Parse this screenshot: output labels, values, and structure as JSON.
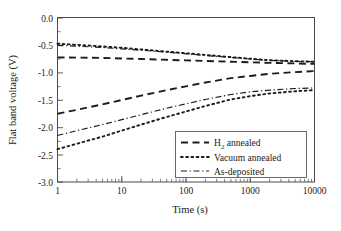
{
  "chart_data": {
    "type": "line",
    "title": "",
    "xlabel": "Time (s)",
    "ylabel": "Flat band voltage (V)",
    "xscale": "log",
    "yscale": "linear",
    "xlim": [
      1,
      10000
    ],
    "ylim": [
      -3.0,
      0.0
    ],
    "grid": false,
    "legend_position": "lower right",
    "xticks": [
      1,
      10,
      100,
      1000,
      10000
    ],
    "xticklabels": [
      "1",
      "10",
      "100",
      "1000",
      "10000"
    ],
    "yticks": [
      0.0,
      -0.5,
      -1.0,
      -1.5,
      -2.0,
      -2.5,
      -3.0
    ],
    "yticklabels": [
      "0.0",
      "-0.5",
      "-1.0",
      "-1.5",
      "-2.0",
      "-2.5",
      "-3.0"
    ],
    "series": [
      {
        "name": "H2 annealed (upper)",
        "legend": "H₂ annealed",
        "style": "dashed",
        "x": [
          1,
          2,
          5,
          10,
          20,
          50,
          100,
          200,
          500,
          1000,
          2000,
          5000,
          10000
        ],
        "y": [
          -0.72,
          -0.725,
          -0.73,
          -0.74,
          -0.75,
          -0.765,
          -0.775,
          -0.785,
          -0.8,
          -0.81,
          -0.82,
          -0.83,
          -0.84
        ]
      },
      {
        "name": "Vacuum annealed (upper)",
        "legend": "Vacuum annealed",
        "style": "dotted",
        "x": [
          1,
          2,
          5,
          10,
          20,
          50,
          100,
          200,
          500,
          1000,
          2000,
          5000,
          10000
        ],
        "y": [
          -0.47,
          -0.49,
          -0.52,
          -0.545,
          -0.575,
          -0.615,
          -0.645,
          -0.675,
          -0.715,
          -0.745,
          -0.772,
          -0.79,
          -0.8
        ]
      },
      {
        "name": "As-deposited (upper)",
        "legend": "As-deposited",
        "style": "dashdot",
        "x": [
          1,
          2,
          5,
          10,
          20,
          50,
          100,
          200,
          500,
          1000,
          2000,
          5000,
          10000
        ],
        "y": [
          -0.5,
          -0.515,
          -0.54,
          -0.565,
          -0.59,
          -0.625,
          -0.655,
          -0.685,
          -0.722,
          -0.75,
          -0.775,
          -0.793,
          -0.8
        ]
      },
      {
        "name": "H2 annealed (lower)",
        "legend": "H₂ annealed",
        "style": "dashed",
        "x": [
          1,
          2,
          5,
          10,
          20,
          50,
          100,
          200,
          500,
          1000,
          2000,
          5000,
          10000
        ],
        "y": [
          -1.75,
          -1.68,
          -1.58,
          -1.5,
          -1.42,
          -1.32,
          -1.25,
          -1.18,
          -1.1,
          -1.06,
          -1.02,
          -0.99,
          -0.97
        ]
      },
      {
        "name": "Vacuum annealed (lower)",
        "legend": "Vacuum annealed",
        "style": "dotted",
        "x": [
          1,
          2,
          5,
          10,
          20,
          50,
          100,
          200,
          500,
          1000,
          2000,
          5000,
          10000
        ],
        "y": [
          -2.4,
          -2.3,
          -2.17,
          -2.06,
          -1.95,
          -1.81,
          -1.71,
          -1.61,
          -1.49,
          -1.43,
          -1.38,
          -1.34,
          -1.32
        ]
      },
      {
        "name": "As-deposited (lower)",
        "legend": "As-deposited",
        "style": "dashdot",
        "x": [
          1,
          2,
          5,
          10,
          20,
          50,
          100,
          200,
          500,
          1000,
          2000,
          5000,
          10000
        ],
        "y": [
          -2.15,
          -2.06,
          -1.95,
          -1.86,
          -1.77,
          -1.65,
          -1.57,
          -1.49,
          -1.4,
          -1.35,
          -1.32,
          -1.29,
          -1.28
        ]
      }
    ],
    "legend_entries": [
      {
        "label": "H₂ annealed",
        "label_main": "H",
        "label_sub": "2",
        "label_rest": " annealed",
        "style": "dashed"
      },
      {
        "label": "Vacuum annealed",
        "label_main": "Vacuum annealed",
        "label_sub": "",
        "label_rest": "",
        "style": "dotted"
      },
      {
        "label": "As-deposited",
        "label_main": "As-deposited",
        "label_sub": "",
        "label_rest": "",
        "style": "dashdot"
      }
    ]
  },
  "axes": {
    "ylabel": "Flat band voltage (V)",
    "xlabel": "Time (s)",
    "ytick_0": "0.0",
    "ytick_1": "-0.5",
    "ytick_2": "-1.0",
    "ytick_3": "-1.5",
    "ytick_4": "-2.0",
    "ytick_5": "-2.5",
    "ytick_6": "-3.0",
    "xtick_0": "1",
    "xtick_1": "10",
    "xtick_2": "100",
    "xtick_3": "1000",
    "xtick_4": "10000"
  },
  "legend": {
    "item_0_main": "H",
    "item_0_sub": "2",
    "item_0_rest": " annealed",
    "item_1_label": "Vacuum annealed",
    "item_2_label": "As-deposited"
  },
  "colors": {
    "line": "#1c1c1c",
    "axis": "#4a4a4a",
    "background": "#ffffff"
  }
}
